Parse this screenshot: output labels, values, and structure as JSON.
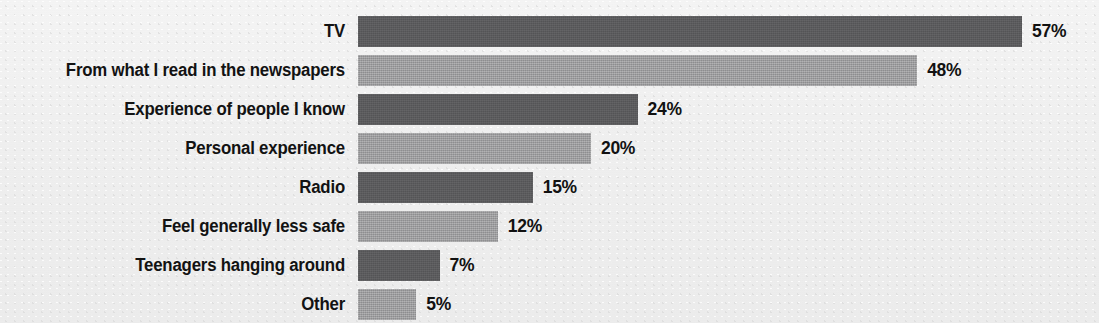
{
  "chart_data": {
    "type": "bar",
    "orientation": "horizontal",
    "title": "",
    "subtitle": "",
    "xlabel": "",
    "ylabel": "",
    "grid": false,
    "legend": false,
    "legend_position": "none",
    "xlim": [
      0,
      57
    ],
    "value_suffix": "%",
    "categories": [
      "TV",
      "From what I read in the newspapers",
      "Experience of people I know",
      "Personal experience",
      "Radio",
      "Feel generally less safe",
      "Teenagers hanging around",
      "Other"
    ],
    "values": [
      57,
      48,
      24,
      20,
      15,
      12,
      7,
      5
    ],
    "value_labels": [
      "57%",
      "48%",
      "24%",
      "20%",
      "15%",
      "12%",
      "7%",
      "5%"
    ],
    "bar_colors": [
      "#58585a",
      "#9b9b9d",
      "#58585a",
      "#9b9b9d",
      "#58585a",
      "#9b9b9d",
      "#58585a",
      "#9b9b9d"
    ],
    "bar_styles": [
      "dark",
      "light",
      "dark",
      "light",
      "dark",
      "light",
      "dark",
      "light"
    ],
    "background_color": "#f1f1f1",
    "label_color": "#121212",
    "value_color": "#111111"
  },
  "layout": {
    "bar_origin_x": 358,
    "px_per_unit": 11.65,
    "row_pitch": 39,
    "first_row_top": 16,
    "bar_height": 31,
    "label_right_edge": 345,
    "value_gap": 10
  }
}
